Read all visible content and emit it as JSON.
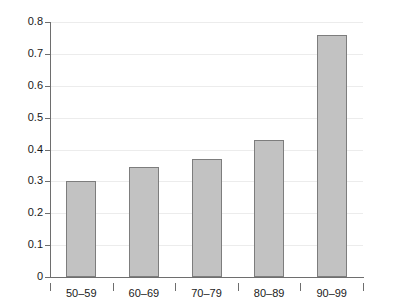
{
  "chart_data": {
    "type": "bar",
    "title": "",
    "subtitle": "",
    "xlabel": "",
    "ylabel": "",
    "categories": [
      "50–59",
      "60–69",
      "70–79",
      "80–89",
      "90–99"
    ],
    "values": [
      0.3,
      0.345,
      0.37,
      0.43,
      0.76
    ],
    "ylim": [
      0,
      0.8
    ],
    "y_ticks": [
      0,
      0.1,
      0.2,
      0.3,
      0.4,
      0.5,
      0.6,
      0.7,
      0.8
    ],
    "y_tick_labels": [
      "0",
      "0.1",
      "0.2",
      "0.3",
      "0.4",
      "0.5",
      "0.6",
      "0.7",
      "0.8"
    ],
    "grid": true,
    "grid_axis": "y",
    "legend": false,
    "legend_position": "none",
    "series": [
      {
        "name": "",
        "values": [
          0.3,
          0.345,
          0.37,
          0.43,
          0.76
        ]
      }
    ],
    "colors": {
      "bar_fill": "#c2c2c2",
      "bar_border": "#7d7d7d",
      "gridline": "#ececec",
      "axis": "#6e6e6e",
      "text": "#1a1a1a",
      "background": "#ffffff"
    }
  }
}
